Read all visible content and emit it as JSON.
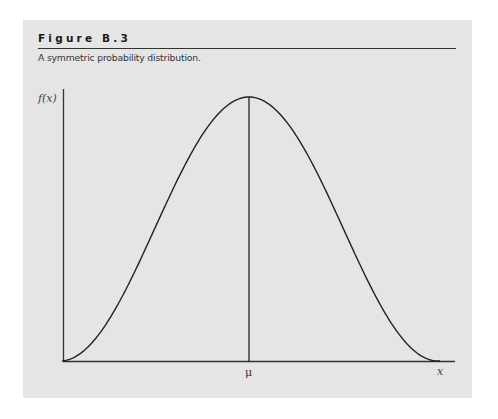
{
  "figure": {
    "title": "Figure B.3",
    "caption": "A symmetric probability distribution."
  },
  "axes": {
    "ylabel": "f(x)",
    "xlabel": "x",
    "center_label": "μ"
  },
  "colors": {
    "panel_background": "#e5e5e5",
    "line": "#222222"
  },
  "chart_data": {
    "type": "line",
    "title": "Figure B.3",
    "subtitle": "A symmetric probability distribution.",
    "xlabel": "x",
    "ylabel": "f(x)",
    "x_ticks": [
      {
        "label": "μ",
        "position": 0.5
      }
    ],
    "grid": false,
    "legend": null,
    "annotations": [
      {
        "type": "vline",
        "x": "μ",
        "label": "μ"
      }
    ],
    "series": [
      {
        "name": "f(x)",
        "x": [
          0,
          0.05,
          0.1,
          0.15,
          0.2,
          0.25,
          0.3,
          0.35,
          0.4,
          0.45,
          0.5,
          0.55,
          0.6,
          0.65,
          0.7,
          0.75,
          0.8,
          0.85,
          0.9,
          0.95,
          1.0
        ],
        "values": [
          0.0,
          0.02,
          0.1,
          0.21,
          0.35,
          0.5,
          0.65,
          0.79,
          0.9,
          0.98,
          1.0,
          0.98,
          0.9,
          0.79,
          0.65,
          0.5,
          0.35,
          0.21,
          0.1,
          0.02,
          0.0
        ]
      }
    ]
  }
}
